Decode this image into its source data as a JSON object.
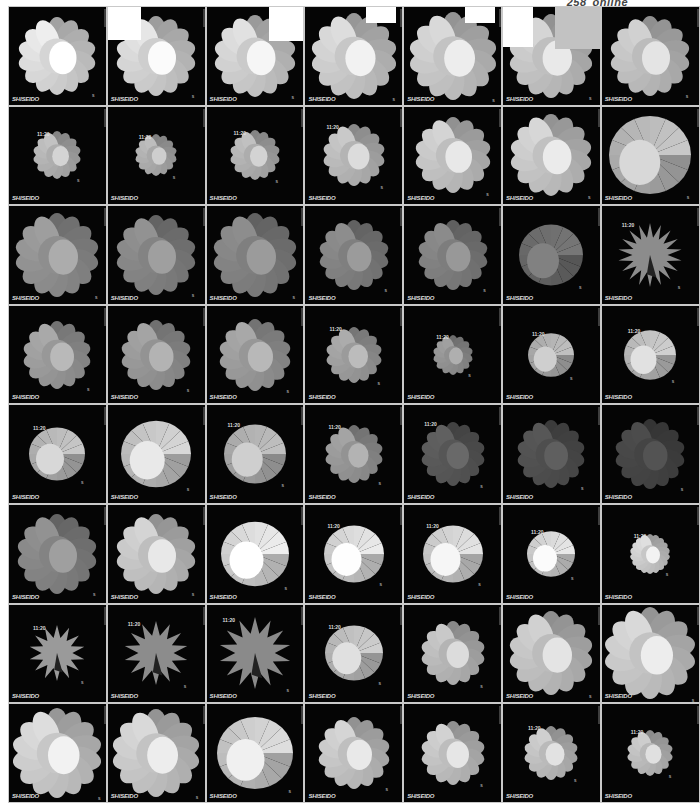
{
  "page": {
    "number": "258",
    "section": "online"
  },
  "frame_common": {
    "logo": "SHISEIDO",
    "time": "11:20",
    "mark": "s"
  },
  "grid": {
    "columns": 7,
    "rows": 8,
    "frames": [
      {
        "row": 1,
        "col": 1,
        "shape": "flower",
        "petals": 14,
        "size": 78,
        "tone": "#e8e8e8",
        "time": false
      },
      {
        "row": 1,
        "col": 2,
        "shape": "flower",
        "petals": 14,
        "size": 80,
        "tone": "#e0e0e0",
        "time": false,
        "overlay": "white-tl"
      },
      {
        "row": 1,
        "col": 3,
        "shape": "flower",
        "petals": 14,
        "size": 82,
        "tone": "#dcdcdc",
        "time": false,
        "overlay": "white-tr"
      },
      {
        "row": 1,
        "col": 4,
        "shape": "flower",
        "petals": 14,
        "size": 86,
        "tone": "#d8d8d8",
        "time": false,
        "overlay": "white-tr-small"
      },
      {
        "row": 1,
        "col": 5,
        "shape": "flower",
        "petals": 14,
        "size": 88,
        "tone": "#d4d4d4",
        "time": false,
        "overlay": "white-tr-small"
      },
      {
        "row": 1,
        "col": 6,
        "shape": "flower",
        "petals": 14,
        "size": 84,
        "tone": "#d0d0d0",
        "time": false,
        "overlay": "white-tl-gray"
      },
      {
        "row": 1,
        "col": 7,
        "shape": "flower",
        "petals": 14,
        "size": 80,
        "tone": "#cccccc",
        "time": false
      },
      {
        "row": 2,
        "col": 1,
        "shape": "flower",
        "petals": 14,
        "size": 48,
        "tone": "#bdbdbd",
        "time": true
      },
      {
        "row": 2,
        "col": 2,
        "shape": "flower",
        "petals": 14,
        "size": 42,
        "tone": "#b8b8b8",
        "time": true
      },
      {
        "row": 2,
        "col": 3,
        "shape": "flower",
        "petals": 14,
        "size": 50,
        "tone": "#bcbcbc",
        "time": true
      },
      {
        "row": 2,
        "col": 4,
        "shape": "flower",
        "petals": 14,
        "size": 62,
        "tone": "#c4c4c4",
        "time": true
      },
      {
        "row": 2,
        "col": 5,
        "shape": "flower",
        "petals": 14,
        "size": 76,
        "tone": "#cfcfcf",
        "time": false
      },
      {
        "row": 2,
        "col": 6,
        "shape": "flower",
        "petals": 14,
        "size": 82,
        "tone": "#d2d2d2",
        "time": false
      },
      {
        "row": 2,
        "col": 7,
        "shape": "disc",
        "petals": 0,
        "size": 82,
        "tone": "#c8c8c8",
        "time": false
      },
      {
        "row": 3,
        "col": 1,
        "shape": "flower",
        "petals": 14,
        "size": 84,
        "tone": "#9a9a9a",
        "time": false
      },
      {
        "row": 3,
        "col": 2,
        "shape": "flower",
        "petals": 14,
        "size": 80,
        "tone": "#8e8e8e",
        "time": false
      },
      {
        "row": 3,
        "col": 3,
        "shape": "flower",
        "petals": 14,
        "size": 84,
        "tone": "#8a8a8a",
        "time": false
      },
      {
        "row": 3,
        "col": 4,
        "shape": "flower",
        "petals": 14,
        "size": 70,
        "tone": "#8a8a8a",
        "time": false
      },
      {
        "row": 3,
        "col": 5,
        "shape": "flower",
        "petals": 14,
        "size": 70,
        "tone": "#888888",
        "time": false
      },
      {
        "row": 3,
        "col": 6,
        "shape": "disc",
        "petals": 0,
        "size": 64,
        "tone": "#777777",
        "time": false
      },
      {
        "row": 3,
        "col": 7,
        "shape": "star",
        "petals": 18,
        "size": 64,
        "tone": "#8c8c8c",
        "time": true
      },
      {
        "row": 4,
        "col": 1,
        "shape": "flower",
        "petals": 14,
        "size": 68,
        "tone": "#a5a5a5",
        "time": false
      },
      {
        "row": 4,
        "col": 2,
        "shape": "flower",
        "petals": 14,
        "size": 70,
        "tone": "#a0a0a0",
        "time": false
      },
      {
        "row": 4,
        "col": 3,
        "shape": "flower",
        "petals": 14,
        "size": 72,
        "tone": "#a4a4a4",
        "time": false
      },
      {
        "row": 4,
        "col": 4,
        "shape": "flower",
        "petals": 14,
        "size": 56,
        "tone": "#a8a8a8",
        "time": true
      },
      {
        "row": 4,
        "col": 5,
        "shape": "flower",
        "petals": 14,
        "size": 40,
        "tone": "#9c9c9c",
        "time": true
      },
      {
        "row": 4,
        "col": 6,
        "shape": "disc",
        "petals": 0,
        "size": 46,
        "tone": "#c0c0c0",
        "time": true
      },
      {
        "row": 4,
        "col": 7,
        "shape": "disc",
        "petals": 0,
        "size": 52,
        "tone": "#d0d0d0",
        "time": true
      },
      {
        "row": 5,
        "col": 1,
        "shape": "disc",
        "petals": 0,
        "size": 56,
        "tone": "#c8c8c8",
        "time": true
      },
      {
        "row": 5,
        "col": 2,
        "shape": "disc",
        "petals": 0,
        "size": 70,
        "tone": "#d8d8d8",
        "time": false
      },
      {
        "row": 5,
        "col": 3,
        "shape": "disc",
        "petals": 0,
        "size": 62,
        "tone": "#c0c0c0",
        "time": true
      },
      {
        "row": 5,
        "col": 4,
        "shape": "flower",
        "petals": 14,
        "size": 58,
        "tone": "#a0a0a0",
        "time": true
      },
      {
        "row": 5,
        "col": 5,
        "shape": "flower",
        "petals": 14,
        "size": 64,
        "tone": "#5e5e5e",
        "time": true
      },
      {
        "row": 5,
        "col": 6,
        "shape": "flower",
        "petals": 14,
        "size": 68,
        "tone": "#555555",
        "time": false
      },
      {
        "row": 5,
        "col": 7,
        "shape": "flower",
        "petals": 14,
        "size": 70,
        "tone": "#4a4a4a",
        "time": false
      },
      {
        "row": 6,
        "col": 1,
        "shape": "flower",
        "petals": 14,
        "size": 80,
        "tone": "#8e8e8e",
        "time": false
      },
      {
        "row": 6,
        "col": 2,
        "shape": "flower",
        "petals": 14,
        "size": 80,
        "tone": "#cfcfcf",
        "time": false
      },
      {
        "row": 6,
        "col": 3,
        "shape": "disc",
        "petals": 0,
        "size": 68,
        "tone": "#efefef",
        "time": false
      },
      {
        "row": 6,
        "col": 4,
        "shape": "disc",
        "petals": 0,
        "size": 60,
        "tone": "#ebebeb",
        "time": true
      },
      {
        "row": 6,
        "col": 5,
        "shape": "disc",
        "petals": 0,
        "size": 60,
        "tone": "#e4e4e4",
        "time": true
      },
      {
        "row": 6,
        "col": 6,
        "shape": "disc",
        "petals": 0,
        "size": 48,
        "tone": "#e8e8e8",
        "time": true
      },
      {
        "row": 6,
        "col": 7,
        "shape": "flower",
        "petals": 18,
        "size": 40,
        "tone": "#d8d8d8",
        "time": true
      },
      {
        "row": 7,
        "col": 1,
        "shape": "star",
        "petals": 14,
        "size": 56,
        "tone": "#9a9a9a",
        "time": true
      },
      {
        "row": 7,
        "col": 2,
        "shape": "star",
        "petals": 14,
        "size": 64,
        "tone": "#8c8c8c",
        "time": true
      },
      {
        "row": 7,
        "col": 3,
        "shape": "star",
        "petals": 14,
        "size": 72,
        "tone": "#8a8a8a",
        "time": true
      },
      {
        "row": 7,
        "col": 4,
        "shape": "disc",
        "petals": 0,
        "size": 58,
        "tone": "#cfcfcf",
        "time": true
      },
      {
        "row": 7,
        "col": 5,
        "shape": "flower",
        "petals": 14,
        "size": 64,
        "tone": "#c4c4c4",
        "time": false
      },
      {
        "row": 7,
        "col": 6,
        "shape": "flower",
        "petals": 14,
        "size": 84,
        "tone": "#cccccc",
        "time": false
      },
      {
        "row": 7,
        "col": 7,
        "shape": "flower",
        "petals": 14,
        "size": 92,
        "tone": "#d4d4d4",
        "time": false
      },
      {
        "row": 8,
        "col": 1,
        "shape": "flower",
        "petals": 14,
        "size": 90,
        "tone": "#d8d8d8",
        "time": false
      },
      {
        "row": 8,
        "col": 2,
        "shape": "flower",
        "petals": 14,
        "size": 88,
        "tone": "#d4d4d4",
        "time": false
      },
      {
        "row": 8,
        "col": 3,
        "shape": "disc",
        "petals": 0,
        "size": 76,
        "tone": "#dedede",
        "time": false
      },
      {
        "row": 8,
        "col": 4,
        "shape": "flower",
        "petals": 14,
        "size": 72,
        "tone": "#d0d0d0",
        "time": false
      },
      {
        "row": 8,
        "col": 5,
        "shape": "flower",
        "petals": 14,
        "size": 64,
        "tone": "#cdcdcd",
        "time": false
      },
      {
        "row": 8,
        "col": 6,
        "shape": "flower",
        "petals": 14,
        "size": 54,
        "tone": "#cacaca",
        "time": true
      },
      {
        "row": 8,
        "col": 7,
        "shape": "flower",
        "petals": 14,
        "size": 46,
        "tone": "#c8c8c8",
        "time": true
      }
    ]
  }
}
